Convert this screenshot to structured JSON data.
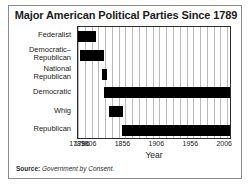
{
  "figure": {
    "title": "Major American Political Parties Since 1789",
    "source_label": "Source:",
    "source_title": "Government by Consent."
  },
  "chart_data": {
    "type": "bar",
    "orientation": "horizontal",
    "title": "Major American Political Parties Since 1789",
    "xlabel": "Year",
    "ylabel": "",
    "xlim": [
      1789,
      2016
    ],
    "grid": true,
    "grid_interval": 10,
    "legend": "none",
    "bar_color": "#000000",
    "xticks": [
      1789,
      1796,
      1806,
      1856,
      1906,
      1956,
      2006
    ],
    "xticklabels": [
      "1789",
      "1796",
      "1806",
      "1856",
      "1906",
      "1956",
      "2006"
    ],
    "categories": [
      "Federalist",
      "Democratic–Republican",
      "National Republican",
      "Democratic",
      "Whig",
      "Republican"
    ],
    "category_lines": [
      [
        "Federalist"
      ],
      [
        "Democratic–",
        "Republican"
      ],
      [
        "National",
        "Republican"
      ],
      [
        "Democratic"
      ],
      [
        "Whig"
      ],
      [
        "Republican"
      ]
    ],
    "spans": [
      {
        "category": "Federalist",
        "start": 1789,
        "end": 1816
      },
      {
        "category": "Democratic–Republican",
        "start": 1792,
        "end": 1828
      },
      {
        "category": "National Republican",
        "start": 1825,
        "end": 1832
      },
      {
        "category": "Democratic",
        "start": 1828,
        "end": 2016
      },
      {
        "category": "Whig",
        "start": 1834,
        "end": 1856
      },
      {
        "category": "Republican",
        "start": 1854,
        "end": 2016
      }
    ]
  }
}
